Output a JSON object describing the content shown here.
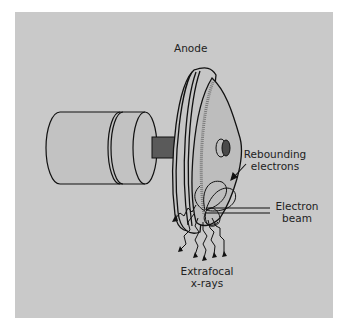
{
  "figure": {
    "labels": {
      "anode": "Anode",
      "rebounding_line1": "Rebounding",
      "rebounding_line2": "electrons",
      "beam_line1": "Electron",
      "beam_line2": "beam",
      "xrays_line1": "Extrafocal",
      "xrays_line2": "x-rays"
    },
    "colors": {
      "background_panel": "#c9c9c9",
      "page": "#ffffff",
      "stroke": "#111111",
      "stem": "#5a5a5a",
      "disc_face": "#bdbdbd",
      "target_track": "#8a8a8a"
    },
    "components": [
      "rotor-cylinder",
      "stem",
      "anode-disc",
      "target-track",
      "hub",
      "electron-beam",
      "rebounding-electrons",
      "extrafocal-x-rays"
    ]
  }
}
